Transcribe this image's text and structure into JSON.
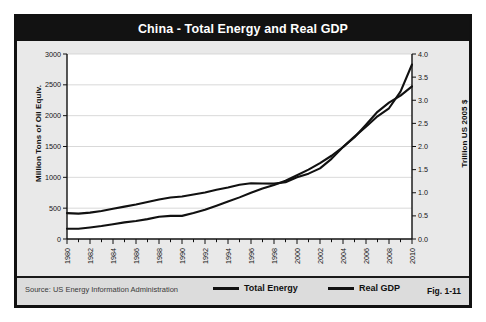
{
  "figure": {
    "title": "China - Total Energy and Real GDP",
    "source": "Source:  US Energy Information Administration",
    "fig_number": "Fig. 1-11"
  },
  "legend": {
    "position": "bottom",
    "items": [
      {
        "label": "Total Energy",
        "color": "#111111"
      },
      {
        "label": "Real GDP",
        "color": "#111111"
      }
    ]
  },
  "chart_data": {
    "type": "line",
    "title": "China - Total Energy and Real GDP",
    "xlabel": "",
    "grid": "horizontal",
    "xlim": [
      1980,
      2010
    ],
    "x": [
      1980,
      1981,
      1982,
      1983,
      1984,
      1985,
      1986,
      1987,
      1988,
      1989,
      1990,
      1991,
      1992,
      1993,
      1994,
      1995,
      1996,
      1997,
      1998,
      1999,
      2000,
      2001,
      2002,
      2003,
      2004,
      2005,
      2006,
      2007,
      2008,
      2009,
      2010
    ],
    "xticklabels": [
      "1980",
      "1982",
      "1984",
      "1986",
      "1988",
      "1990",
      "1992",
      "1994",
      "1996",
      "1998",
      "2000",
      "2002",
      "2004",
      "2006",
      "2008",
      "2010"
    ],
    "axes": [
      {
        "side": "left",
        "ylabel": "Million Tons of Oil Equiv.",
        "ylim": [
          0,
          3000
        ],
        "yticks": [
          0,
          500,
          1000,
          1500,
          2000,
          2500,
          3000
        ],
        "yticklabels": [
          "0",
          "500",
          "1000",
          "1500",
          "2000",
          "2500",
          "3000"
        ]
      },
      {
        "side": "right",
        "ylabel": "Trillion US 2005 $",
        "ylim": [
          0.0,
          4.0
        ],
        "yticks": [
          0.0,
          0.5,
          1.0,
          1.5,
          2.0,
          2.5,
          3.0,
          3.5,
          4.0
        ],
        "yticklabels": [
          "0.0",
          "0.5",
          "1.0",
          "1.5",
          "2.0",
          "2.5",
          "3.0",
          "3.5",
          "4.0"
        ]
      }
    ],
    "series": [
      {
        "name": "Total Energy",
        "axis": "left",
        "units": "Million Tons of Oil Equiv.",
        "color": "#111111",
        "values": [
          420,
          412,
          428,
          455,
          490,
          525,
          560,
          600,
          640,
          672,
          690,
          722,
          755,
          800,
          835,
          880,
          905,
          900,
          898,
          920,
          1000,
          1060,
          1145,
          1300,
          1490,
          1660,
          1820,
          1990,
          2120,
          2390,
          2830
        ]
      },
      {
        "name": "Real GDP",
        "axis": "right",
        "units": "Trillion US 2005 $",
        "color": "#111111",
        "values": [
          0.22,
          0.22,
          0.25,
          0.28,
          0.32,
          0.36,
          0.39,
          0.43,
          0.48,
          0.5,
          0.5,
          0.56,
          0.63,
          0.72,
          0.81,
          0.9,
          1.0,
          1.09,
          1.17,
          1.26,
          1.38,
          1.5,
          1.64,
          1.8,
          1.99,
          2.2,
          2.47,
          2.75,
          2.95,
          3.1,
          3.3
        ]
      }
    ]
  }
}
